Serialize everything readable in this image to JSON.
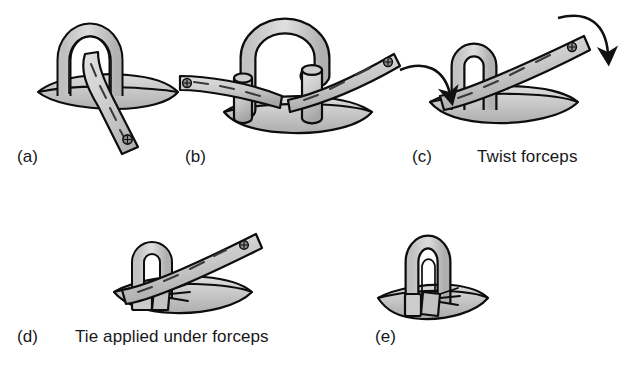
{
  "figure": {
    "background_color": "#ffffff",
    "width": 631,
    "height": 380
  },
  "palette": {
    "outline": "#0d0d0d",
    "tissue_light": "#d3d3d3",
    "tissue_mid": "#b9b9b9",
    "tissue_dark": "#a0a0a0",
    "instrument_light": "#d8d8d8",
    "instrument_mid": "#bdbdbd",
    "highlight": "#eaeaea",
    "text": "#17181a",
    "arrow": "#111111"
  },
  "panels": [
    {
      "id": "a",
      "label": "(a)",
      "caption": "",
      "description": "Loop of suture passed through tissue with forceps tip entering the loop",
      "elements": [
        "tissue-base",
        "suture-loop",
        "forceps-arm",
        "forceps-rivet"
      ]
    },
    {
      "id": "b",
      "label": "(b)",
      "caption": "",
      "description": "Arched suture loop with two cut tube ends, forceps jaws opened on either side",
      "elements": [
        "tissue-base",
        "suture-arch",
        "tube-end-left",
        "tube-end-right",
        "forceps-arm-left",
        "forceps-arm-right",
        "forceps-rivet"
      ]
    },
    {
      "id": "c",
      "label": "(c)",
      "caption": "Twist forceps",
      "description": "Forceps gripping the loop, curved arrows indicate rotation of the instrument",
      "elements": [
        "tissue-base",
        "suture-loop",
        "forceps-arm",
        "forceps-rivet",
        "rotation-arrow-left",
        "rotation-arrow-right"
      ]
    },
    {
      "id": "d",
      "label": "(d)",
      "caption": "Tie applied under forceps",
      "description": "Ligature band tightened beneath the forceps jaws around the twisted loop",
      "elements": [
        "tissue-base",
        "suture-loop",
        "forceps-arm",
        "forceps-rivet",
        "tie-band",
        "thread-ends"
      ]
    },
    {
      "id": "e",
      "label": "(e)",
      "caption": "",
      "description": "Completed ligature — forceps removed leaving the tied loop standing in the tissue",
      "elements": [
        "tissue-base",
        "suture-loop",
        "tie-band",
        "thread-ends"
      ]
    }
  ],
  "captions": {
    "twist_forceps": "Twist forceps",
    "tie_applied": "Tie applied under forceps"
  },
  "labels": {
    "a": "(a)",
    "b": "(b)",
    "c": "(c)",
    "d": "(d)",
    "e": "(e)"
  },
  "arrows": [
    {
      "id": "rotation-arrow-left",
      "direction": "curve-down-right",
      "panel": "c"
    },
    {
      "id": "rotation-arrow-right",
      "direction": "curve-down-right",
      "panel": "c"
    }
  ]
}
